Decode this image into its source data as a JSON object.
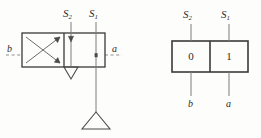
{
  "figure": {
    "type": "engineering-diagram",
    "stroke_color": "#3a3a3a",
    "dash_color": "#8a8a8a",
    "text_color": "#2b2b2b",
    "background": "#fdfdfb"
  },
  "valve_diagram": {
    "name": "valve-symbol",
    "signal_labels": {
      "left": {
        "base": "S",
        "sub": "2"
      },
      "right": {
        "base": "S",
        "sub": "1"
      }
    },
    "port_labels": {
      "left": "b",
      "right": "a"
    },
    "cells": [
      {
        "name": "crossed-cell",
        "symbol": "crossed-arrows"
      },
      {
        "name": "parallel-cell",
        "symbol": "straight-arrow"
      }
    ],
    "tank_symbol": "triangle"
  },
  "state_table": {
    "name": "state-table",
    "signal_labels": {
      "left": {
        "base": "S",
        "sub": "2"
      },
      "right": {
        "base": "S",
        "sub": "1"
      }
    },
    "cell_values": [
      "0",
      "1"
    ],
    "output_labels": {
      "left": "b",
      "right": "a"
    }
  }
}
